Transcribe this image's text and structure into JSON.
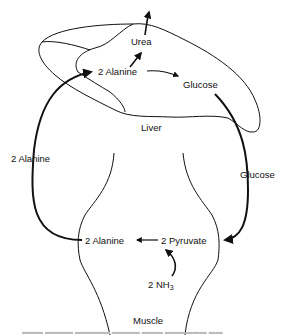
{
  "diagram": {
    "organs": {
      "liver": "Liver",
      "muscle": "Muscle"
    },
    "liver_labels": {
      "urea": "Urea",
      "alanine": "2 Alanine",
      "glucose": "Glucose"
    },
    "transport_labels": {
      "alanine_to_liver": "2 Alanine",
      "glucose_to_muscle": "Glucose"
    },
    "muscle_labels": {
      "alanine": "2 Alanine",
      "pyruvate": "2 Pyruvate",
      "ammonia_prefix": "2 NH",
      "ammonia_sub": "3"
    },
    "arrows": [
      {
        "from": "2 Alanine (muscle)",
        "to": "2 Alanine (liver)"
      },
      {
        "from": "2 Alanine (liver)",
        "to": "Urea"
      },
      {
        "from": "Urea",
        "to": "out"
      },
      {
        "from": "2 Alanine (liver)",
        "to": "Glucose (liver)"
      },
      {
        "from": "Glucose (liver)",
        "to": "2 Pyruvate (muscle)"
      },
      {
        "from": "2 Pyruvate",
        "to": "2 Alanine (muscle)"
      },
      {
        "from": "2 NH3",
        "to": "2 Pyruvate"
      }
    ],
    "colors": {
      "line": "#111111",
      "background": "#ffffff"
    }
  }
}
